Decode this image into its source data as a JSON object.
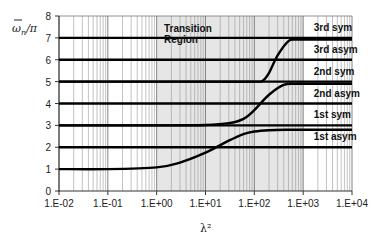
{
  "chart_data": {
    "type": "line",
    "title": "",
    "xlabel": "λ²",
    "ylabel": "ω̄ₙ/π",
    "xscale": "log",
    "xlim": [
      0.01,
      10000
    ],
    "ylim": [
      0,
      8
    ],
    "x_tick_labels": [
      "1.E-02",
      "1.E-01",
      "1.E+00",
      "1.E+01",
      "1.E+02",
      "1.E+03",
      "1.E+04"
    ],
    "y_tick_labels": [
      "0",
      "1",
      "2",
      "3",
      "4",
      "5",
      "6",
      "7",
      "8"
    ],
    "grid": {
      "x_minor_log": true,
      "y": false
    },
    "shaded_region": {
      "label": "Transition Region",
      "x_start": 1,
      "x_end": 1000,
      "color": "#e6e6e6"
    },
    "series": [
      {
        "name": "1st asym",
        "style": "flat",
        "x": [
          0.01,
          10000
        ],
        "values": [
          2,
          2
        ]
      },
      {
        "name": "1st sym",
        "style": "flat",
        "x": [
          0.01,
          10000
        ],
        "values": [
          3,
          3
        ]
      },
      {
        "name": "2nd asym",
        "style": "flat",
        "x": [
          0.01,
          10000
        ],
        "values": [
          4,
          4
        ]
      },
      {
        "name": "2nd sym",
        "style": "flat",
        "x": [
          0.01,
          10000
        ],
        "values": [
          5,
          5
        ]
      },
      {
        "name": "3rd asym",
        "style": "flat",
        "x": [
          0.01,
          10000
        ],
        "values": [
          6,
          6
        ]
      },
      {
        "name": "3rd sym",
        "style": "flat",
        "x": [
          0.01,
          10000
        ],
        "values": [
          7,
          7
        ]
      },
      {
        "name": "mode 1 transition",
        "style": "curve",
        "x": [
          0.01,
          0.1,
          1,
          3,
          10,
          30,
          60,
          100,
          200,
          500,
          1000,
          10000
        ],
        "values": [
          1.0,
          1.0,
          1.08,
          1.3,
          1.75,
          2.3,
          2.6,
          2.72,
          2.78,
          2.8,
          2.8,
          2.8
        ]
      },
      {
        "name": "mode 2 transition",
        "style": "curve",
        "x": [
          0.01,
          1,
          10,
          30,
          60,
          100,
          200,
          400,
          700,
          1000,
          10000
        ],
        "values": [
          3.0,
          3.0,
          3.02,
          3.1,
          3.3,
          3.7,
          4.4,
          4.85,
          4.9,
          4.9,
          4.9
        ]
      },
      {
        "name": "mode 3 transition",
        "style": "curve",
        "x": [
          0.01,
          10,
          100,
          150,
          200,
          300,
          500,
          700,
          1000,
          10000
        ],
        "values": [
          5.0,
          5.0,
          5.0,
          5.05,
          5.4,
          6.2,
          6.85,
          6.92,
          6.92,
          6.92
        ]
      }
    ],
    "annotations": [
      {
        "text": "3rd sym",
        "x": 1500,
        "y": 7.5
      },
      {
        "text": "3rd asym",
        "x": 1500,
        "y": 6.5
      },
      {
        "text": "2nd sym",
        "x": 1500,
        "y": 5.5
      },
      {
        "text": "2nd asym",
        "x": 1500,
        "y": 4.5
      },
      {
        "text": "1st sym",
        "x": 1500,
        "y": 3.5
      },
      {
        "text": "1st asym",
        "x": 1500,
        "y": 2.5
      }
    ]
  }
}
